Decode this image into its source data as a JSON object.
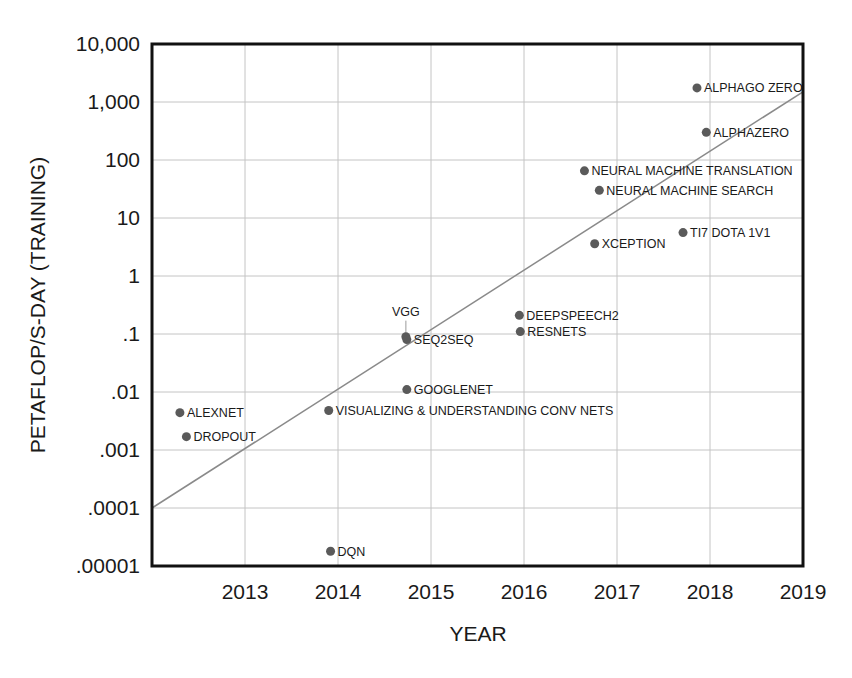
{
  "chart_data": {
    "type": "scatter",
    "title": "",
    "xlabel": "YEAR",
    "ylabel": "PETAFLOP/S-DAY (TRAINING)",
    "x_scale": "linear",
    "y_scale": "log",
    "xlim": [
      2012,
      2019
    ],
    "ylim": [
      1e-05,
      10000
    ],
    "grid": true,
    "legend": null,
    "x_ticks": [
      2013,
      2014,
      2015,
      2016,
      2017,
      2018,
      2019
    ],
    "x_tick_labels": [
      "2013",
      "2014",
      "2015",
      "2016",
      "2017",
      "2018",
      "2019"
    ],
    "y_ticks": [
      10000,
      1000,
      100,
      10,
      1,
      0.1,
      0.01,
      0.001,
      0.0001,
      1e-05
    ],
    "y_tick_labels": [
      "10,000",
      "1,000",
      "100",
      "10",
      "1",
      ".1",
      ".01",
      ".001",
      ".0001",
      ".00001"
    ],
    "points": [
      {
        "label": "ALPHAGO ZERO",
        "x": 2017.86,
        "y": 1750
      },
      {
        "label": "ALPHAZERO",
        "x": 2017.96,
        "y": 300
      },
      {
        "label": "NEURAL MACHINE TRANSLATION",
        "x": 2016.65,
        "y": 65
      },
      {
        "label": "NEURAL MACHINE SEARCH",
        "x": 2016.81,
        "y": 30
      },
      {
        "label": "TI7 DOTA 1V1",
        "x": 2017.71,
        "y": 5.6
      },
      {
        "label": "XCEPTION",
        "x": 2016.76,
        "y": 3.6
      },
      {
        "label": "DEEPSPEECH2",
        "x": 2015.95,
        "y": 0.21
      },
      {
        "label": "RESNETS",
        "x": 2015.96,
        "y": 0.11
      },
      {
        "label": "VGG",
        "x": 2014.73,
        "y": 0.09
      },
      {
        "label": "SEQ2SEQ",
        "x": 2014.74,
        "y": 0.08
      },
      {
        "label": "GOOGLENET",
        "x": 2014.74,
        "y": 0.011
      },
      {
        "label": "VISUALIZING & UNDERSTANDING CONV NETS",
        "x": 2013.9,
        "y": 0.0048
      },
      {
        "label": "ALEXNET",
        "x": 2012.3,
        "y": 0.0044
      },
      {
        "label": "DROPOUT",
        "x": 2012.37,
        "y": 0.0017
      },
      {
        "label": "DQN",
        "x": 2013.92,
        "y": 1.8e-05
      }
    ],
    "trend_line": {
      "x": [
        2012,
        2019
      ],
      "y": [
        0.0001,
        1500
      ],
      "description": "exponential trend line"
    },
    "colors": {
      "points": "#5a5a5a",
      "trend": "#8a8a8a",
      "grid": "#c4c4c4",
      "frame": "#111111"
    }
  },
  "labels": {
    "x_axis_title": "YEAR",
    "y_axis_title": "PETAFLOP/S-DAY (TRAINING)"
  }
}
